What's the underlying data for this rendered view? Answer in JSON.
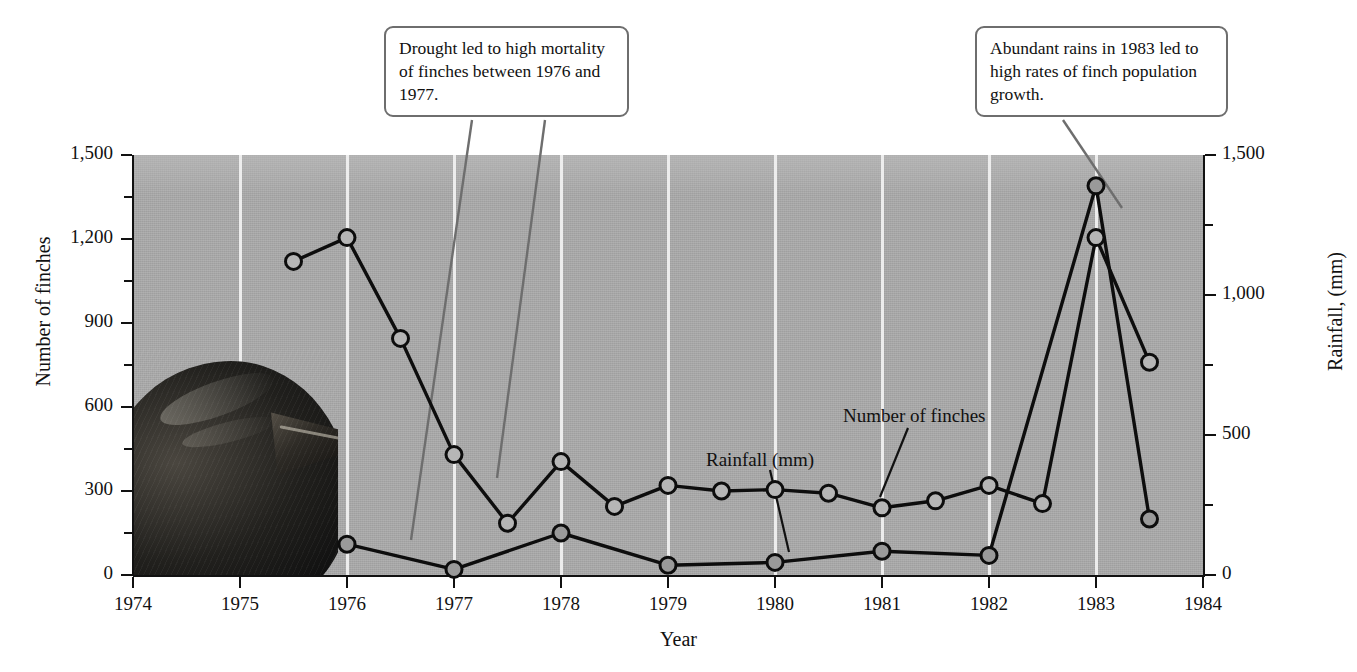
{
  "chart_data": {
    "type": "line",
    "title": "",
    "xlabel": "Year",
    "ylabel": "Number of finches",
    "y2label": "Rainfall, (mm)",
    "xlim": [
      1974,
      1984
    ],
    "ylim": [
      0,
      1500
    ],
    "y2lim": [
      0,
      1500
    ],
    "grid": "vertical white gridlines at each year",
    "legend": "inline labels with leader lines",
    "plot_background": "#a8a8a8",
    "x_ticks": [
      "1974",
      "1975",
      "1976",
      "1977",
      "1978",
      "1979",
      "1980",
      "1981",
      "1982",
      "1983",
      "1984"
    ],
    "y_ticks_left": [
      "0",
      "300",
      "600",
      "900",
      "1,200",
      "1,500"
    ],
    "y_ticks_right": [
      "0",
      "500",
      "1,000",
      "1,500"
    ],
    "series": [
      {
        "name": "Number of finches",
        "axis": "left",
        "marker": "open-circle",
        "x": [
          1975.5,
          1976.0,
          1976.5,
          1977.0,
          1977.5,
          1978.0,
          1978.5,
          1979.0,
          1979.5,
          1980.0,
          1980.5,
          1981.0,
          1981.5,
          1982.0,
          1982.5,
          1983.0,
          1983.5
        ],
        "values": [
          1120,
          1205,
          845,
          430,
          185,
          405,
          245,
          320,
          300,
          305,
          292,
          240,
          265,
          320,
          255,
          1205,
          760
        ]
      },
      {
        "name": "Rainfall (mm)",
        "axis": "right",
        "marker": "filled-circle",
        "x": [
          1976.0,
          1977.0,
          1978.0,
          1979.0,
          1980.0,
          1981.0,
          1982.0,
          1983.0,
          1983.5
        ],
        "values": [
          110,
          20,
          150,
          35,
          45,
          85,
          70,
          1390,
          200
        ]
      }
    ]
  },
  "axes": {
    "left": {
      "title": "Number of finches",
      "ticks": [
        {
          "label": "1,500",
          "value": 1500
        },
        {
          "label": "",
          "value": 1350
        },
        {
          "label": "1,200",
          "value": 1200
        },
        {
          "label": "",
          "value": 1050
        },
        {
          "label": "900",
          "value": 900
        },
        {
          "label": "",
          "value": 750
        },
        {
          "label": "600",
          "value": 600
        },
        {
          "label": "",
          "value": 450
        },
        {
          "label": "300",
          "value": 300
        },
        {
          "label": "",
          "value": 150
        },
        {
          "label": "0",
          "value": 0
        }
      ]
    },
    "right": {
      "title": "Rainfall, (mm)",
      "ticks": [
        {
          "label": "1,500",
          "value": 1500
        },
        {
          "label": "",
          "value": 1250
        },
        {
          "label": "1,000",
          "value": 1000
        },
        {
          "label": "",
          "value": 750
        },
        {
          "label": "500",
          "value": 500
        },
        {
          "label": "",
          "value": 250
        },
        {
          "label": "0",
          "value": 0
        }
      ]
    },
    "bottom": {
      "title": "Year",
      "ticks": [
        "1974",
        "1975",
        "1976",
        "1977",
        "1978",
        "1979",
        "1980",
        "1981",
        "1982",
        "1983",
        "1984"
      ]
    }
  },
  "callouts": [
    {
      "id": "drought",
      "text": "Drought led to high mortality of finches between 1976 and 1977."
    },
    {
      "id": "rains",
      "text": "Abundant rains in 1983 led to high rates of finch population growth."
    }
  ],
  "series_labels": {
    "rainfall": "Rainfall (mm)",
    "finches": "Number of finches"
  },
  "photo": {
    "subject": "finch-head-photo"
  },
  "bottom_caption": ""
}
